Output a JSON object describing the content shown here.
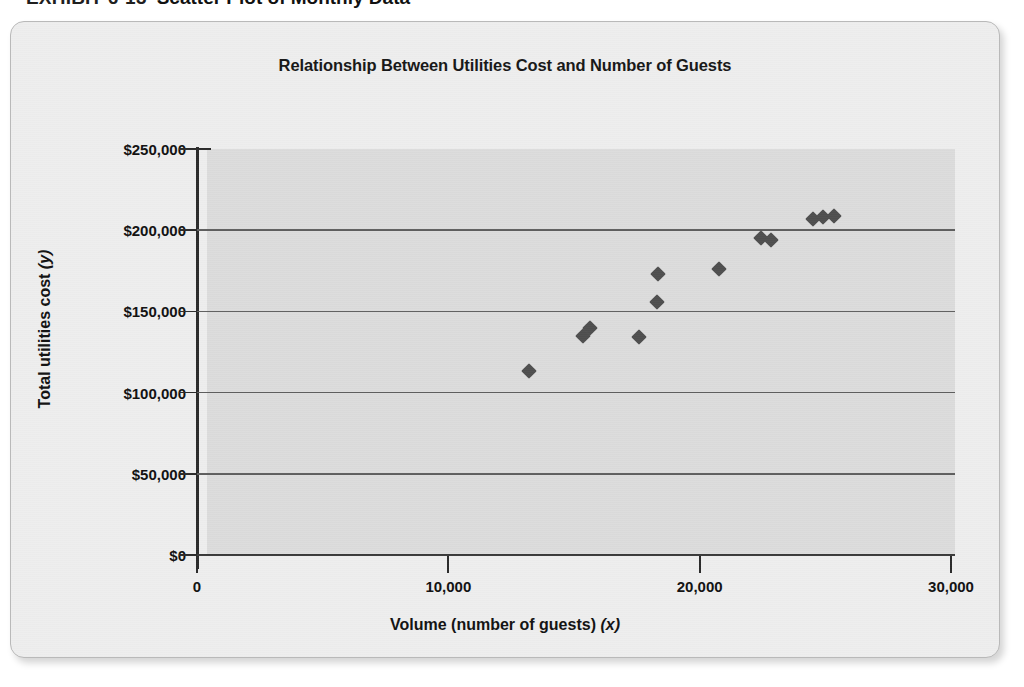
{
  "exhibit": {
    "label": "EXHIBIT 6-13",
    "title": "Scatter Plot of Monthly Data"
  },
  "chart_data": {
    "type": "scatter",
    "title": "Relationship Between Utilities Cost and Number of Guests",
    "xlabel": "Volume (number of guests) (x)",
    "xlabel_text": "Volume (number of guests)",
    "xlabel_var": "(x)",
    "ylabel": "Total utilities cost (y)",
    "ylabel_text": "Total utilities cost",
    "ylabel_var": "(y)",
    "xlim": [
      0,
      30000
    ],
    "ylim": [
      0,
      250000
    ],
    "xticks": [
      0,
      10000,
      20000,
      30000
    ],
    "xtick_labels": [
      "0",
      "10,000",
      "20,000",
      "30,000"
    ],
    "yticks": [
      0,
      50000,
      100000,
      150000,
      200000,
      250000
    ],
    "ytick_labels": [
      "$0",
      "$50,000",
      "$100,000",
      "$150,000",
      "$200,000",
      "$250,000"
    ],
    "grid": "horizontal",
    "legend": "none",
    "marker": "diamond",
    "marker_color": "#4f4f4f",
    "plot_background": "#dcdcdc",
    "points": [
      {
        "x": 13200,
        "y": 113000
      },
      {
        "x": 15350,
        "y": 135000
      },
      {
        "x": 15650,
        "y": 140000
      },
      {
        "x": 17600,
        "y": 134000
      },
      {
        "x": 18300,
        "y": 156000
      },
      {
        "x": 18350,
        "y": 173000
      },
      {
        "x": 20750,
        "y": 176000
      },
      {
        "x": 22450,
        "y": 195000
      },
      {
        "x": 22850,
        "y": 194000
      },
      {
        "x": 24500,
        "y": 207000
      },
      {
        "x": 24900,
        "y": 208000
      },
      {
        "x": 25350,
        "y": 209000
      }
    ]
  },
  "colors": {
    "card_background": "#eeeeee",
    "card_border": "#b9b9b9",
    "axis": "#2b2b2b",
    "gridline": "#5f5f5f",
    "text": "#111111"
  }
}
